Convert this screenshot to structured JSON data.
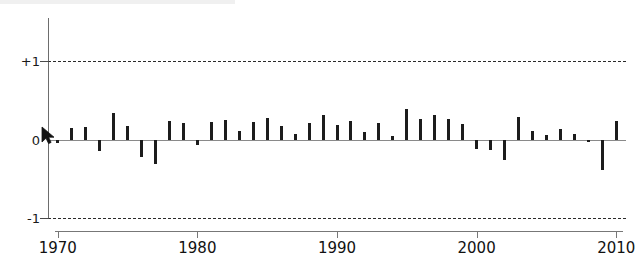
{
  "chart_data": {
    "type": "bar",
    "title": "",
    "subtitle": "",
    "xlabel": "",
    "ylabel": "",
    "xlim": [
      1969.3,
      2010.7
    ],
    "ylim": [
      -1,
      1
    ],
    "grid": true,
    "gridlines": [
      1,
      -1
    ],
    "legend": null,
    "x_tick_labels": [
      "1970",
      "1980",
      "1990",
      "2000",
      "2010"
    ],
    "x_ticks": [
      1970,
      1980,
      1990,
      2000,
      2010
    ],
    "y_tick_labels": [
      "+1",
      "0",
      "-1"
    ],
    "y_ticks": [
      1,
      0,
      -1
    ],
    "categories": [
      1970,
      1971,
      1972,
      1973,
      1974,
      1975,
      1976,
      1977,
      1978,
      1979,
      1980,
      1981,
      1982,
      1983,
      1984,
      1985,
      1986,
      1987,
      1988,
      1989,
      1990,
      1991,
      1992,
      1993,
      1994,
      1995,
      1996,
      1997,
      1998,
      1999,
      2000,
      2001,
      2002,
      2003,
      2004,
      2005,
      2006,
      2007,
      2008,
      2009,
      2010
    ],
    "values": [
      -0.04,
      0.15,
      0.16,
      -0.14,
      0.34,
      0.18,
      -0.22,
      -0.3,
      0.24,
      0.21,
      -0.06,
      0.23,
      0.25,
      0.11,
      0.23,
      0.28,
      0.18,
      0.07,
      0.22,
      0.32,
      0.19,
      0.24,
      0.1,
      0.21,
      0.05,
      0.39,
      0.26,
      0.32,
      0.27,
      0.2,
      -0.11,
      -0.13,
      -0.25,
      0.29,
      0.12,
      0.06,
      0.14,
      0.07,
      -0.02,
      -0.38,
      0.24
    ]
  },
  "cursor": {
    "name": "mouse-pointer",
    "x": 41,
    "y": 126
  }
}
